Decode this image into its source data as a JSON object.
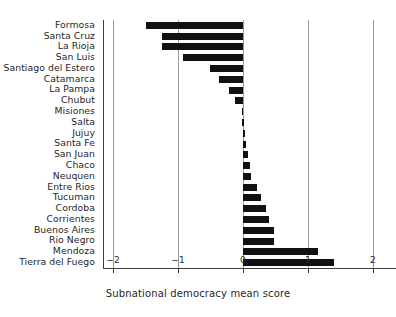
{
  "chart_data": {
    "type": "bar",
    "orientation": "horizontal",
    "title": "",
    "xlabel": "Subnational democracy mean score",
    "ylabel": "",
    "xlim": [
      -2,
      2
    ],
    "xticks": [
      -2,
      -1,
      0,
      1,
      2
    ],
    "xticklabels": [
      "−2",
      "−1",
      "0",
      "1",
      "2"
    ],
    "grid": true,
    "grid_axis": "x",
    "legend": "none",
    "bar_color": "#111111",
    "categories": [
      "Formosa",
      "Santa Cruz",
      "La Rioja",
      "San Luis",
      "Santiago del Estero",
      "Catamarca",
      "La Pampa",
      "Chubut",
      "Misiones",
      "Salta",
      "Jujuy",
      "Santa Fe",
      "San Juan",
      "Chaco",
      "Neuquen",
      "Entre Rios",
      "Tucuman",
      "Cordoba",
      "Corrientes",
      "Buenos Aires",
      "Rio Negro",
      "Mendoza",
      "Tierra del Fuego"
    ],
    "values": [
      -1.49,
      -1.25,
      -1.25,
      -0.92,
      -0.51,
      -0.37,
      -0.22,
      -0.13,
      -0.02,
      -0.01,
      0.03,
      0.05,
      0.07,
      0.1,
      0.13,
      0.21,
      0.28,
      0.35,
      0.4,
      0.48,
      0.48,
      1.15,
      1.4
    ]
  },
  "axis": {
    "xlabel_text": "Subnational democracy mean score"
  }
}
